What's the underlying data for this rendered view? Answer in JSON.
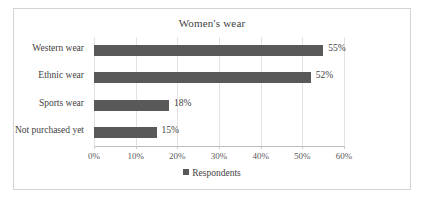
{
  "chart_data": {
    "type": "bar",
    "orientation": "horizontal",
    "title": "Women's wear",
    "categories": [
      "Western wear",
      "Ethnic wear",
      "Sports wear",
      "Not purchased yet"
    ],
    "values": [
      55,
      52,
      18,
      15
    ],
    "value_labels": [
      "55%",
      "52%",
      "18%",
      "15%"
    ],
    "series": [
      {
        "name": "Respondents",
        "values": [
          55,
          52,
          18,
          15
        ],
        "color": "#595959"
      }
    ],
    "xlabel": "",
    "ylabel": "",
    "xlim": [
      0,
      60
    ],
    "xticks": [
      0,
      10,
      20,
      30,
      40,
      50,
      60
    ],
    "xtick_labels": [
      "0%",
      "10%",
      "20%",
      "30%",
      "40%",
      "50%",
      "60%"
    ],
    "grid": "vertical",
    "legend": {
      "position": "bottom",
      "entries": [
        {
          "label": "Respondents",
          "color": "#595959",
          "marker": "square"
        }
      ]
    },
    "colors": {
      "bar": "#595959",
      "gridline": "#e2e2e2",
      "axis": "#bdbdbd",
      "border": "#d4d4d4",
      "text": "#3f3f3f",
      "background": "#ffffff"
    }
  }
}
